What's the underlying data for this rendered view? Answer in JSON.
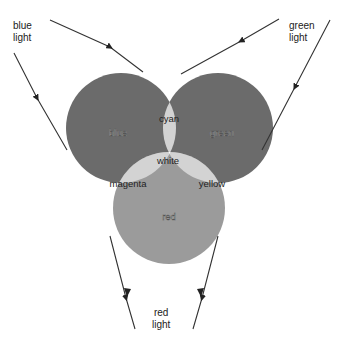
{
  "sources": {
    "blue": {
      "line1": "blue",
      "line2": "light"
    },
    "green": {
      "line1": "green",
      "line2": "light"
    },
    "red": {
      "line1": "red",
      "line2": "light"
    }
  },
  "regions": {
    "blue": "blue",
    "green": "green",
    "red": "red",
    "cyan": "cyan",
    "magenta": "magenta",
    "yellow": "yellow",
    "white": "white"
  },
  "colors": {
    "primary_fill": "#6e6e6e",
    "red_fill": "#9a9a9a",
    "secondary_fill": "#d4d4d4",
    "white_fill": "#ffffff",
    "ray": "#333333"
  }
}
